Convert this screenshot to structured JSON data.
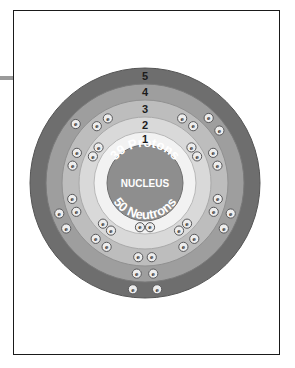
{
  "figure": {
    "kind": "bohr-atom-shell-diagram",
    "element_implied": "Yttrium-89",
    "frame": {
      "border_color": "#1a1a1a",
      "fill": "#ffffff"
    },
    "leader_line": {
      "color": "#9a9a9a"
    }
  },
  "nucleus": {
    "protons_label": "39 Protons",
    "center_label": "NUCLEUS",
    "neutrons_label": "50 Neutrons",
    "fill": "#8e8e8e",
    "stroke": "#6f6f6f",
    "text_color": "#ffffff",
    "proton_count": 39,
    "neutron_count": 50
  },
  "electron": {
    "symbol": "e",
    "fill": "#ededed",
    "stroke": "#58585a",
    "text_color": "#2a2a2a"
  },
  "shells": [
    {
      "number": "1",
      "label": "1",
      "electrons": 2,
      "fill": "#f2f2f2",
      "stroke": "#b8b8b8",
      "r_outer": 51,
      "r_inner": 38
    },
    {
      "number": "2",
      "label": "2",
      "electrons": 8,
      "fill": "#d9d9d9",
      "stroke": "#a9a9a9",
      "r_outer": 66,
      "r_inner": 51
    },
    {
      "number": "3",
      "label": "3",
      "electrons": 18,
      "fill": "#bdbdbd",
      "stroke": "#909090",
      "r_outer": 83,
      "r_inner": 66
    },
    {
      "number": "4",
      "label": "4",
      "electrons": 9,
      "fill": "#9e9e9e",
      "stroke": "#7a7a7a",
      "r_outer": 99,
      "r_inner": 83
    },
    {
      "number": "5",
      "label": "5",
      "electrons": 2,
      "fill": "#6e6e6e",
      "stroke": "#555555",
      "r_outer": 115,
      "r_inner": 99
    }
  ],
  "chart_data": {
    "type": "diagram",
    "center_x": 145,
    "center_y": 183,
    "shell_radii": [
      51,
      66,
      83,
      99,
      115
    ],
    "shell_numbers": [
      "1",
      "2",
      "3",
      "4",
      "5"
    ],
    "electrons_per_shell": [
      2,
      8,
      18,
      9,
      2
    ],
    "total_electrons": 39,
    "nucleus_text": [
      "39 Protons",
      "NUCLEUS",
      "50 Neutrons"
    ]
  }
}
